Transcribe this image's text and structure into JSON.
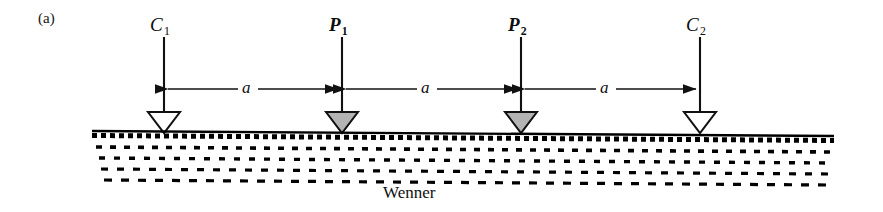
{
  "figure": {
    "panel_label": "(a)",
    "array_name": "Wenner",
    "ink_color": "#111111",
    "ground_color": "#000000",
    "current_electrode_fill": "#ffffff",
    "potential_electrode_fill": "#b4b4b4"
  },
  "electrodes": [
    {
      "id": "C1",
      "label": "C",
      "subscript": "1",
      "type": "current",
      "x": 164,
      "label_x": 150,
      "label_y": 18
    },
    {
      "id": "P1",
      "label": "P",
      "subscript": "1",
      "type": "potential",
      "x": 342,
      "label_x": 329,
      "label_y": 18
    },
    {
      "id": "P2",
      "label": "P",
      "subscript": "2",
      "type": "potential",
      "x": 521,
      "label_x": 508,
      "label_y": 18
    },
    {
      "id": "C2",
      "label": "C",
      "subscript": "2",
      "type": "current",
      "x": 700,
      "label_x": 686,
      "label_y": 18
    }
  ],
  "spacings": [
    {
      "id": "a1",
      "label": "a",
      "from": "C1",
      "to": "P1",
      "label_x": 247,
      "label_y": 78
    },
    {
      "id": "a2",
      "label": "a",
      "from": "P1",
      "to": "P2",
      "label_x": 426,
      "label_y": 78
    },
    {
      "id": "a3",
      "label": "a",
      "from": "P2",
      "to": "C2",
      "label_x": 605,
      "label_y": 78
    }
  ],
  "ground": {
    "surface_y": 131,
    "left_x": 92,
    "right_x": 834,
    "layer_count": 4,
    "label_x": 415,
    "label_y": 184
  },
  "icons": {
    "electrode": "triangle-down-icon",
    "arrow_left": "arrow-left-icon",
    "arrow_right": "arrow-right-icon",
    "ground": "ground-hatch-icon"
  }
}
